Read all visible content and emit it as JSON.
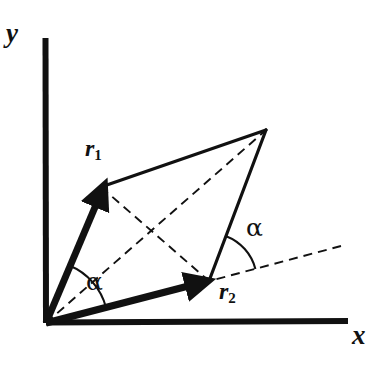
{
  "figure": {
    "background_color": "#ffffff",
    "ink_color": "#111111",
    "width": 384,
    "height": 365
  },
  "axes": {
    "x_label": "x",
    "y_label": "y",
    "origin": [
      46,
      323
    ],
    "x_axis": {
      "from": [
        46,
        323
      ],
      "to": [
        348,
        321
      ],
      "stroke_width": 6
    },
    "y_axis": {
      "from": [
        45,
        38
      ],
      "to": [
        46,
        323
      ],
      "stroke_width": 6
    }
  },
  "vectors": [
    {
      "name": "r1",
      "label": "r",
      "subscript": "1",
      "from": [
        46,
        323
      ],
      "to": [
        101,
        187
      ],
      "stroke_width": 7,
      "style": "solid",
      "arrowhead": true
    },
    {
      "name": "r2",
      "label": "r",
      "subscript": "2",
      "from": [
        46,
        323
      ],
      "to": [
        209,
        281
      ],
      "stroke_width": 7,
      "style": "solid",
      "arrowhead": true
    }
  ],
  "parallelogram": {
    "apex": [
      266,
      130
    ],
    "edges": [
      {
        "name": "edge-r1-to-apex",
        "from": [
          101,
          187
        ],
        "to": [
          266,
          130
        ],
        "stroke_width": 3,
        "style": "solid"
      },
      {
        "name": "edge-r2-to-apex",
        "from": [
          209,
          281
        ],
        "to": [
          266,
          130
        ],
        "stroke_width": 3,
        "style": "solid"
      }
    ]
  },
  "dashed_lines": [
    {
      "name": "diagonal-origin-to-apex",
      "from": [
        46,
        323
      ],
      "to": [
        266,
        130
      ],
      "stroke_width": 2,
      "dash": "8 6"
    },
    {
      "name": "diagonal-r1-to-r2",
      "from": [
        101,
        187
      ],
      "to": [
        209,
        281
      ],
      "stroke_width": 2,
      "dash": "8 6"
    },
    {
      "name": "r2-direction-extension",
      "from": [
        209,
        281
      ],
      "to": [
        341,
        246
      ],
      "stroke_width": 2,
      "dash": "8 6"
    }
  ],
  "angle_arcs": [
    {
      "name": "angle-at-origin",
      "label": "α",
      "vertex": [
        46,
        323
      ],
      "radius": 62,
      "from_deg": -68,
      "to_deg": -14.5
    },
    {
      "name": "angle-at-r2",
      "label": "α",
      "vertex": [
        209,
        281
      ],
      "radius": 48,
      "from_deg": -69,
      "to_deg": -14.5
    }
  ],
  "labels": {
    "y": "y",
    "x": "x",
    "r1_base": "r",
    "r1_sub": "1",
    "r2_base": "r",
    "r2_sub": "2",
    "alpha_origin": "α",
    "alpha_r2": "α"
  }
}
